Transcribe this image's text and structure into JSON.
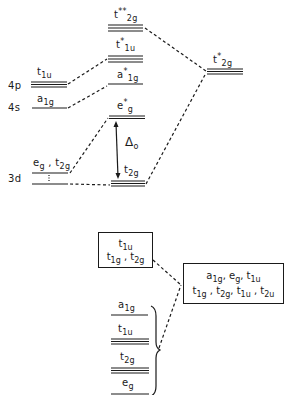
{
  "diagram": {
    "type": "molecular-orbital-energy-level-diagram",
    "atomic_orbitals": {
      "4p": {
        "label": "4p",
        "symmetry": "t",
        "symmetry_sub": "1u",
        "degeneracy": 3
      },
      "4s": {
        "label": "4s",
        "symmetry": "a",
        "symmetry_sub": "1g",
        "degeneracy": 1
      },
      "3d": {
        "label": "3d",
        "symmetry_a": "e",
        "symmetry_a_sub": "g",
        "sep": " , ",
        "symmetry_b": "t",
        "symmetry_b_sub": "2g",
        "degeneracy": 5
      }
    },
    "molecular_orbitals": [
      {
        "name": "t2g**",
        "base": "t",
        "star": "**",
        "sub": "2g",
        "degeneracy": 3
      },
      {
        "name": "t1u*",
        "base": "t",
        "star": "*",
        "sub": "1u",
        "degeneracy": 3
      },
      {
        "name": "a1g*",
        "base": "a",
        "star": "*",
        "sub": "1g",
        "degeneracy": 1
      },
      {
        "name": "eg*",
        "base": "e",
        "star": "*",
        "sub": "g",
        "degeneracy": 2
      },
      {
        "name": "t2g",
        "base": "t",
        "star": "",
        "sub": "2g",
        "degeneracy": 3
      }
    ],
    "ligand_orbital": {
      "name": "t2g*",
      "base": "t",
      "star": "*",
      "sub": "2g",
      "degeneracy": 3
    },
    "splitting": {
      "symbol": "Δ",
      "sub": "o"
    },
    "lower_section": {
      "upper_box": {
        "line1": [
          {
            "b": "t",
            "s": "1u"
          }
        ],
        "line2": [
          {
            "b": "t",
            "s": "1g"
          },
          {
            "sep": " , "
          },
          {
            "b": "t",
            "s": "2g"
          }
        ]
      },
      "right_box": {
        "line1": [
          {
            "b": "a",
            "s": "1g"
          },
          {
            "sep": ", "
          },
          {
            "b": "e",
            "s": "g"
          },
          {
            "sep": ", "
          },
          {
            "b": "t",
            "s": "1u"
          }
        ],
        "line2": [
          {
            "b": "t",
            "s": "1g"
          },
          {
            "sep": " , "
          },
          {
            "b": "t",
            "s": "2g"
          },
          {
            "sep": ", "
          },
          {
            "b": "t",
            "s": "1u"
          },
          {
            "sep": " , "
          },
          {
            "b": "t",
            "s": "2u"
          }
        ]
      },
      "levels": [
        {
          "base": "a",
          "sub": "1g",
          "degeneracy": 1
        },
        {
          "base": "t",
          "sub": "1u",
          "degeneracy": 3
        },
        {
          "base": "t",
          "sub": "2g",
          "degeneracy": 3
        },
        {
          "base": "e",
          "sub": "g",
          "degeneracy": 2
        }
      ]
    },
    "colors": {
      "ink": "#1a1a1a",
      "background": "#ffffff"
    }
  }
}
